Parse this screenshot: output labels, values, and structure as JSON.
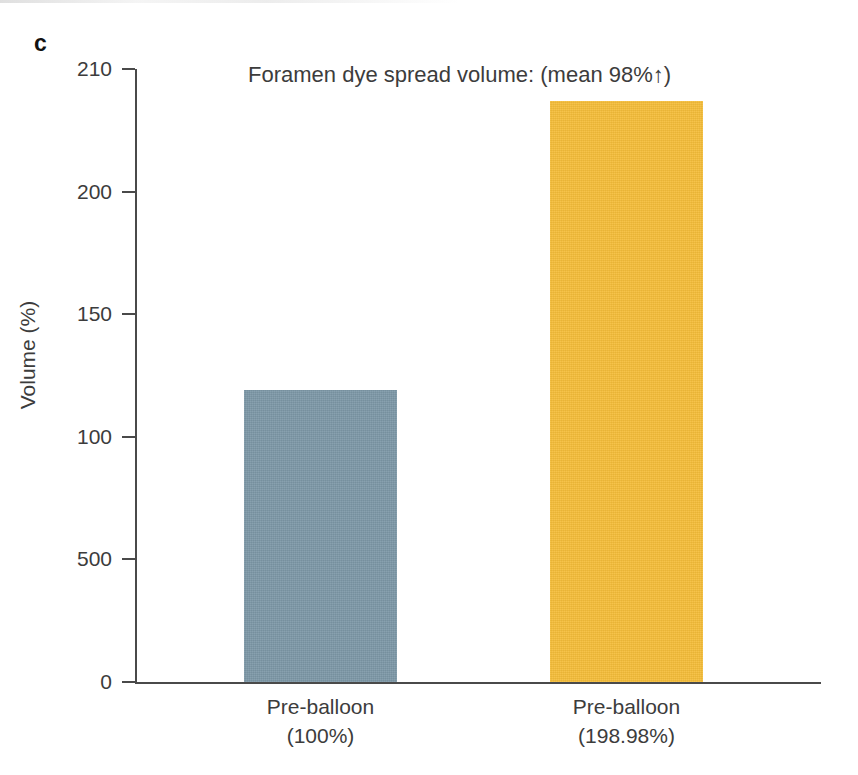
{
  "panel": {
    "label": "c"
  },
  "chart_data": {
    "type": "bar",
    "title": "Foramen dye spread volume: (mean 98%↑)",
    "xlabel": "",
    "ylabel": "Volume (%)",
    "categories": [
      "Pre-balloon",
      "Pre-balloon"
    ],
    "category_sublabels": [
      "(100%)",
      "(198.98%)"
    ],
    "values": [
      100,
      198.98
    ],
    "bar_colors": [
      "#7e99a8",
      "#f5bd38"
    ],
    "ylim": [
      0,
      210
    ],
    "ytick_labels": [
      "210",
      "200",
      "150",
      "100",
      "500",
      "0"
    ],
    "ytick_values": [
      210,
      200,
      150,
      100,
      50,
      0
    ],
    "grid": false,
    "legend": null,
    "annotations": [
      "mean 98%↑"
    ]
  },
  "colors": {
    "bar_blue": "#7e99a8",
    "bar_yellow": "#f5bd38",
    "axis": "#4a4a4a",
    "text": "#3c3c3c",
    "background": "#ffffff"
  }
}
